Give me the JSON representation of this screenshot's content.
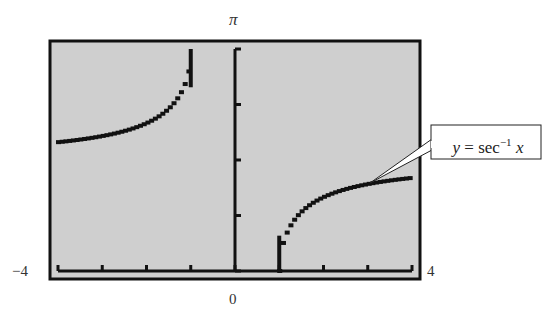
{
  "chart_data": {
    "type": "line",
    "title": "",
    "function": "y = sec^-1 x",
    "annotation": {
      "text_prefix": "y",
      "text_eq": " = sec",
      "text_sup": "−1",
      "text_var": " x"
    },
    "xlabel": "",
    "ylabel": "",
    "x_range": [
      -4,
      4
    ],
    "y_range": [
      0,
      3.1416
    ],
    "x_tick_labels": {
      "min": "−4",
      "max": "4",
      "origin": "0"
    },
    "y_tick_labels": {
      "max": "π"
    },
    "x_ticks": [
      -4,
      -3,
      -2,
      -1,
      0,
      1,
      2,
      3,
      4
    ],
    "y_ticks": [
      0,
      0.785,
      1.571,
      2.356,
      3.1416
    ],
    "grid": false,
    "legend": null,
    "series": [
      {
        "name": "sec^-1 x (x ≤ -1)",
        "x": [
          -4,
          -3.5,
          -3,
          -2.5,
          -2,
          -1.75,
          -1.5,
          -1.25,
          -1.1,
          -1
        ],
        "y": [
          1.823,
          1.855,
          1.911,
          1.982,
          2.094,
          2.178,
          2.301,
          2.498,
          2.711,
          3.1416
        ]
      },
      {
        "name": "sec^-1 x (x ≥ 1)",
        "x": [
          1,
          1.1,
          1.25,
          1.5,
          1.75,
          2,
          2.5,
          3,
          3.5,
          4
        ],
        "y": [
          0,
          0.43,
          0.644,
          0.841,
          0.963,
          1.047,
          1.159,
          1.231,
          1.281,
          1.318
        ]
      }
    ],
    "colors": {
      "background": "#cfcfcf",
      "curve": "#111111",
      "frame": "#111111"
    }
  }
}
